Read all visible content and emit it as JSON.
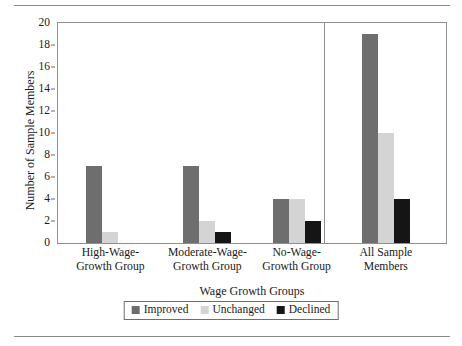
{
  "chart_data": {
    "type": "bar",
    "title": "",
    "xlabel": "Wage Growth Groups",
    "ylabel": "Number of Sample Members",
    "ylim": [
      0,
      20
    ],
    "ytick_step": 2,
    "yticks": [
      "0",
      "2",
      "4",
      "6",
      "8",
      "10",
      "12",
      "14",
      "16",
      "18",
      "20"
    ],
    "grid": false,
    "legend_position": "bottom-center",
    "categories": [
      "High-Wage-Growth Group",
      "Moderate-Wage-Growth Group",
      "No-Wage-Growth Group",
      "All Sample Members"
    ],
    "category_lines": [
      [
        "High-Wage-",
        "Growth Group"
      ],
      [
        "Moderate-Wage-",
        "Growth Group"
      ],
      [
        "No-Wage-",
        "Growth Group"
      ],
      [
        "All Sample",
        "Members"
      ]
    ],
    "series": [
      {
        "name": "Improved",
        "color": "#6e6e6e",
        "values": [
          7,
          7,
          4,
          19
        ]
      },
      {
        "name": "Unchanged",
        "color": "#d4d4d4",
        "values": [
          1,
          2,
          4,
          10
        ]
      },
      {
        "name": "Declined",
        "color": "#151515",
        "values": [
          0,
          1,
          2,
          4
        ]
      }
    ],
    "annotations": [
      "Vertical divider separates the three wage-growth groups from the All Sample Members cluster"
    ]
  },
  "legend": {
    "items": [
      {
        "label": "Improved",
        "swatch": "improved-swatch"
      },
      {
        "label": "Unchanged",
        "swatch": "unchanged-swatch"
      },
      {
        "label": "Declined",
        "swatch": "declined-swatch"
      }
    ]
  },
  "axes": {
    "y_title": "Number of Sample Members",
    "x_title": "Wage Growth Groups"
  },
  "colors": {
    "improved": "#6e6e6e",
    "unchanged": "#d4d4d4",
    "declined": "#151515",
    "frame": "#8f8f8f",
    "rule": "#8a8a8a",
    "text": "#1a1a1a"
  }
}
